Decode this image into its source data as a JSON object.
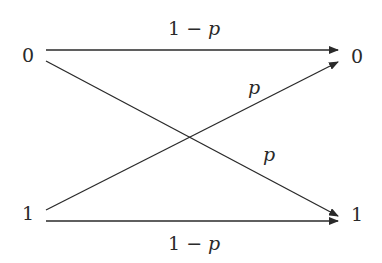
{
  "diagram": {
    "inputs": [
      {
        "label": "0"
      },
      {
        "label": "1"
      }
    ],
    "outputs": [
      {
        "label": "0"
      },
      {
        "label": "1"
      }
    ],
    "edges": [
      {
        "from": "0",
        "to": "0",
        "label_prefix": "1 − ",
        "label_var": "p"
      },
      {
        "from": "0",
        "to": "1",
        "label_prefix": "",
        "label_var": "p"
      },
      {
        "from": "1",
        "to": "0",
        "label_prefix": "",
        "label_var": "p"
      },
      {
        "from": "1",
        "to": "1",
        "label_prefix": "1 − ",
        "label_var": "p"
      }
    ],
    "colors": {
      "line": "#2a2a2a",
      "background": "#ffffff"
    }
  }
}
